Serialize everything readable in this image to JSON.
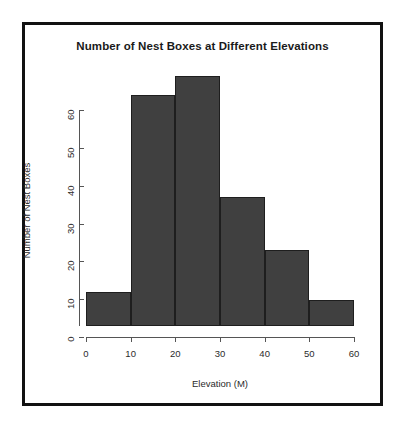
{
  "chart_data": {
    "type": "bar",
    "title": "Number of Nest Boxes at Different Elevations",
    "xlabel": "Elevation (M)",
    "ylabel": "Number of Nest Boxes",
    "categories": [
      "0-10",
      "10-20",
      "20-30",
      "30-40",
      "40-50",
      "50-60"
    ],
    "bin_edges": [
      0,
      10,
      20,
      30,
      40,
      50,
      60
    ],
    "values": [
      9,
      61,
      66,
      34,
      20,
      7
    ],
    "xlim": [
      0,
      60
    ],
    "ylim": [
      0,
      66
    ],
    "x_ticks": [
      0,
      10,
      20,
      30,
      40,
      50,
      60
    ],
    "x_tick_labels": [
      "0",
      "10",
      "20",
      "30",
      "40",
      "50",
      "60"
    ],
    "y_ticks": [
      0,
      10,
      20,
      30,
      40,
      50,
      60
    ],
    "y_tick_labels": [
      "0",
      "10",
      "20",
      "30",
      "40",
      "50",
      "60"
    ],
    "grid": false,
    "legend": false,
    "bar_color": "#404040",
    "bar_border_color": "#1e1e1e",
    "background_color": "#ffffff",
    "frame_color": "#111111"
  }
}
